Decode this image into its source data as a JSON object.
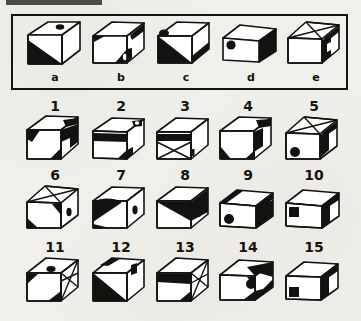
{
  "page": {
    "background_color": "#f1efe9",
    "ink_color": "#141210",
    "paper_note": "scanned test-booklet page"
  },
  "key_panel": {
    "name": "reference-cube-row",
    "border_color": "#141210",
    "items": [
      {
        "label": "a",
        "description": "cube with small dark oval on top face, black lower-left triangle on front face, plain right face",
        "marks": [
          "oval-top",
          "black-triangle-front-lower-left"
        ]
      },
      {
        "label": "b",
        "description": "cube with black band along top right edge, small black wedge at upper left, black triangle with white dot at bottom right of front face",
        "marks": [
          "black-band-top-right",
          "black-wedge-upper-left",
          "black-triangle-dot-bottom-right"
        ]
      },
      {
        "label": "c",
        "description": "cube with black oval at upper left of front face, black lower-left triangle on front face, dark right face",
        "marks": [
          "oval-upper-left",
          "black-triangle-front-lower-left",
          "dark-right-face"
        ]
      },
      {
        "label": "d",
        "description": "wide flat cube with black dot at upper left of front face and solid black right face",
        "marks": [
          "black-dot-upper-left",
          "solid-black-right-face"
        ]
      },
      {
        "label": "e",
        "description": "cube with star / X pattern on top face and black right face with white triangular notch",
        "marks": [
          "star-pattern-top",
          "black-right-face-notch"
        ]
      }
    ]
  },
  "answer_grid": {
    "name": "numbered-cube-grid",
    "rows": 3,
    "columns": 5,
    "items": [
      {
        "label": "1",
        "description": "black wedge at top right of top face, black triangle on left of front face, black zigzag on right face",
        "marks": [
          "black-wedge-top-right",
          "black-triangle-front-left",
          "black-zigzag-right-face"
        ]
      },
      {
        "label": "2",
        "description": "black band across upper front face, small dark mark top right of top face, black triangle at bottom right",
        "marks": [
          "black-band-upper-front",
          "dark-mark-top-right",
          "black-triangle-bottom-right"
        ]
      },
      {
        "label": "3",
        "description": "black band at top of front face, X pattern across front face, small dark mark at right edge",
        "marks": [
          "black-band-top-front",
          "x-pattern-front",
          "dark-mark-right-edge"
        ]
      },
      {
        "label": "4",
        "description": "black wedge at top right of top face, black triangle bottom left of front, black triangle on right face",
        "marks": [
          "black-wedge-top-right",
          "black-triangle-bottom-left",
          "black-triangle-right-face"
        ]
      },
      {
        "label": "5",
        "description": "star pattern on top face, dark right face, black dot at lower left of front face",
        "marks": [
          "star-pattern-top",
          "dark-right-face",
          "black-dot-lower-left"
        ]
      },
      {
        "label": "6",
        "description": "star pattern on top face, black triangle upper right of front face, dark oval on right face, black triangle bottom left",
        "marks": [
          "star-pattern-top",
          "black-triangle-upper-right",
          "oval-right-face",
          "black-triangle-bottom-left"
        ]
      },
      {
        "label": "7",
        "description": "large black curved triangular shape on left of front face, dark oval on right face",
        "marks": [
          "black-curved-shape-front-left",
          "oval-right-face"
        ]
      },
      {
        "label": "8",
        "description": "black triangle on upper front face, dark right face, small dark mark on right face",
        "marks": [
          "black-triangle-upper-front",
          "dark-right-face",
          "dark-mark-right-face"
        ]
      },
      {
        "label": "9",
        "description": "black bands along top edges, black triangle on right face, black dot at lower left of front face",
        "marks": [
          "black-bands-top",
          "black-triangle-right-face",
          "black-dot-lower-left"
        ]
      },
      {
        "label": "10",
        "description": "black band on top right edge, black square at upper left of front face",
        "marks": [
          "black-band-top-right",
          "black-square-upper-left"
        ]
      },
      {
        "label": "11",
        "description": "dark oval on top face, black triangle upper left of front, X lines on right face, black triangle at bottom",
        "marks": [
          "oval-top",
          "black-triangle-upper-left",
          "x-pattern-right-face",
          "black-triangle-bottom"
        ]
      },
      {
        "label": "12",
        "description": "black marks on top face, black triangle filling lower left of front face, dark mark on right face",
        "marks": [
          "black-marks-top",
          "black-triangle-lower-left",
          "dark-mark-right-face"
        ]
      },
      {
        "label": "13",
        "description": "black band on upper front face, X pattern on right face, black triangle at bottom of front face",
        "marks": [
          "black-band-upper-front",
          "x-pattern-right-face",
          "black-triangle-bottom"
        ]
      },
      {
        "label": "14",
        "description": "black triangle at top right, black dot on front face, black triangle at bottom right",
        "marks": [
          "black-triangle-top-right",
          "black-dot-front",
          "black-triangle-bottom-right"
        ]
      },
      {
        "label": "15",
        "description": "black band along top right edge, dark right face, black square at lower left of front face",
        "marks": [
          "black-band-top-right",
          "dark-right-face",
          "black-square-lower-left"
        ]
      }
    ]
  }
}
